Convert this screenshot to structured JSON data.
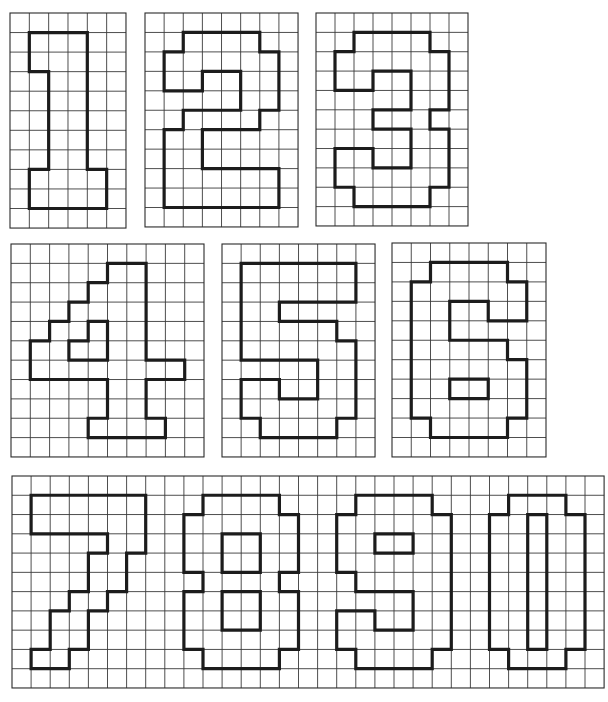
{
  "colors": {
    "background": "#ffffff",
    "grid": "#3a3a3a",
    "outline": "#1c1c1c"
  },
  "grids": [
    {
      "id": "grid-1",
      "label": "1",
      "x": 10,
      "y": 13,
      "cols": 6,
      "rows": 11,
      "cell_w": 19.33,
      "cell_h": 19.55,
      "digits": [
        {
          "digit": "1",
          "polygons": [
            [
              [
                1,
                1
              ],
              [
                4,
                1
              ],
              [
                4,
                8
              ],
              [
                5,
                8
              ],
              [
                5,
                10
              ],
              [
                1,
                10
              ],
              [
                1,
                8
              ],
              [
                2,
                8
              ],
              [
                2,
                3
              ],
              [
                1,
                3
              ]
            ]
          ]
        }
      ]
    },
    {
      "id": "grid-2",
      "label": "2",
      "x": 145,
      "y": 13,
      "cols": 8,
      "rows": 11,
      "cell_w": 19.13,
      "cell_h": 19.45,
      "digits": [
        {
          "digit": "2",
          "polygons": [
            [
              [
                2,
                1
              ],
              [
                6,
                1
              ],
              [
                6,
                2
              ],
              [
                7,
                2
              ],
              [
                7,
                5
              ],
              [
                6,
                5
              ],
              [
                6,
                6
              ],
              [
                3,
                6
              ],
              [
                3,
                8
              ],
              [
                7,
                8
              ],
              [
                7,
                10
              ],
              [
                1,
                10
              ],
              [
                1,
                6
              ],
              [
                2,
                6
              ],
              [
                2,
                5
              ],
              [
                5,
                5
              ],
              [
                5,
                3
              ],
              [
                3,
                3
              ],
              [
                3,
                4
              ],
              [
                1,
                4
              ],
              [
                1,
                2
              ],
              [
                2,
                2
              ]
            ]
          ]
        }
      ]
    },
    {
      "id": "grid-3",
      "label": "3",
      "x": 316,
      "y": 13,
      "cols": 8,
      "rows": 11,
      "cell_w": 19.0,
      "cell_h": 19.36,
      "digits": [
        {
          "digit": "3",
          "polygons": [
            [
              [
                2,
                1
              ],
              [
                6,
                1
              ],
              [
                6,
                2
              ],
              [
                7,
                2
              ],
              [
                7,
                5
              ],
              [
                6,
                5
              ],
              [
                6,
                6
              ],
              [
                7,
                6
              ],
              [
                7,
                9
              ],
              [
                6,
                9
              ],
              [
                6,
                10
              ],
              [
                2,
                10
              ],
              [
                2,
                9
              ],
              [
                1,
                9
              ],
              [
                1,
                7
              ],
              [
                3,
                7
              ],
              [
                3,
                8
              ],
              [
                5,
                8
              ],
              [
                5,
                6
              ],
              [
                3,
                6
              ],
              [
                3,
                5
              ],
              [
                5,
                5
              ],
              [
                5,
                3
              ],
              [
                3,
                3
              ],
              [
                3,
                4
              ],
              [
                1,
                4
              ],
              [
                1,
                2
              ],
              [
                2,
                2
              ]
            ]
          ]
        }
      ]
    },
    {
      "id": "grid-4",
      "label": "4",
      "x": 11,
      "y": 244,
      "cols": 10,
      "rows": 11,
      "cell_w": 19.3,
      "cell_h": 19.36,
      "digits": [
        {
          "digit": "4",
          "polygons": [
            [
              [
                5,
                1
              ],
              [
                7,
                1
              ],
              [
                7,
                6
              ],
              [
                9,
                6
              ],
              [
                9,
                7
              ],
              [
                7,
                7
              ],
              [
                7,
                9
              ],
              [
                8,
                9
              ],
              [
                8,
                10
              ],
              [
                4,
                10
              ],
              [
                4,
                9
              ],
              [
                5,
                9
              ],
              [
                5,
                7
              ],
              [
                1,
                7
              ],
              [
                1,
                5
              ],
              [
                2,
                5
              ],
              [
                2,
                4
              ],
              [
                3,
                4
              ],
              [
                3,
                3
              ],
              [
                4,
                3
              ],
              [
                4,
                2
              ],
              [
                5,
                2
              ]
            ],
            [
              [
                4,
                4
              ],
              [
                5,
                4
              ],
              [
                5,
                6
              ],
              [
                3,
                6
              ],
              [
                3,
                5
              ],
              [
                4,
                5
              ]
            ]
          ]
        }
      ]
    },
    {
      "id": "grid-5",
      "label": "5",
      "x": 222,
      "y": 244,
      "cols": 8,
      "rows": 11,
      "cell_w": 19.13,
      "cell_h": 19.36,
      "digits": [
        {
          "digit": "5",
          "polygons": [
            [
              [
                1,
                1
              ],
              [
                7,
                1
              ],
              [
                7,
                3
              ],
              [
                3,
                3
              ],
              [
                3,
                4
              ],
              [
                6,
                4
              ],
              [
                6,
                5
              ],
              [
                7,
                5
              ],
              [
                7,
                9
              ],
              [
                6,
                9
              ],
              [
                6,
                10
              ],
              [
                2,
                10
              ],
              [
                2,
                9
              ],
              [
                1,
                9
              ],
              [
                1,
                7
              ],
              [
                3,
                7
              ],
              [
                3,
                8
              ],
              [
                5,
                8
              ],
              [
                5,
                6
              ],
              [
                1,
                6
              ]
            ]
          ]
        }
      ]
    },
    {
      "id": "grid-6",
      "label": "6",
      "x": 392,
      "y": 243,
      "cols": 8,
      "rows": 11,
      "cell_w": 19.25,
      "cell_h": 19.45,
      "digits": [
        {
          "digit": "6",
          "polygons": [
            [
              [
                2,
                1
              ],
              [
                6,
                1
              ],
              [
                6,
                2
              ],
              [
                7,
                2
              ],
              [
                7,
                4
              ],
              [
                5,
                4
              ],
              [
                5,
                3
              ],
              [
                3,
                3
              ],
              [
                3,
                5
              ],
              [
                6,
                5
              ],
              [
                6,
                6
              ],
              [
                7,
                6
              ],
              [
                7,
                9
              ],
              [
                6,
                9
              ],
              [
                6,
                10
              ],
              [
                2,
                10
              ],
              [
                2,
                9
              ],
              [
                1,
                9
              ],
              [
                1,
                2
              ],
              [
                2,
                2
              ]
            ],
            [
              [
                3,
                7
              ],
              [
                5,
                7
              ],
              [
                5,
                8
              ],
              [
                3,
                8
              ]
            ]
          ]
        }
      ]
    },
    {
      "id": "grid-7890",
      "label": "7 8 9 0",
      "x": 12,
      "y": 476,
      "cols": 31,
      "rows": 11,
      "cell_w": 19.1,
      "cell_h": 19.27,
      "digits": [
        {
          "digit": "7",
          "polygons": [
            [
              [
                1,
                1
              ],
              [
                7,
                1
              ],
              [
                7,
                4
              ],
              [
                6,
                4
              ],
              [
                6,
                6
              ],
              [
                5,
                6
              ],
              [
                5,
                7
              ],
              [
                4,
                7
              ],
              [
                4,
                9
              ],
              [
                3,
                9
              ],
              [
                3,
                10
              ],
              [
                1,
                10
              ],
              [
                1,
                9
              ],
              [
                2,
                9
              ],
              [
                2,
                7
              ],
              [
                3,
                7
              ],
              [
                3,
                6
              ],
              [
                4,
                6
              ],
              [
                4,
                4
              ],
              [
                5,
                4
              ],
              [
                5,
                3
              ],
              [
                1,
                3
              ]
            ]
          ]
        },
        {
          "digit": "8",
          "polygons": [
            [
              [
                10,
                1
              ],
              [
                14,
                1
              ],
              [
                14,
                2
              ],
              [
                15,
                2
              ],
              [
                15,
                5
              ],
              [
                14,
                5
              ],
              [
                14,
                6
              ],
              [
                15,
                6
              ],
              [
                15,
                9
              ],
              [
                14,
                9
              ],
              [
                14,
                10
              ],
              [
                10,
                10
              ],
              [
                10,
                9
              ],
              [
                9,
                9
              ],
              [
                9,
                6
              ],
              [
                10,
                6
              ],
              [
                10,
                5
              ],
              [
                9,
                5
              ],
              [
                9,
                2
              ],
              [
                10,
                2
              ]
            ],
            [
              [
                11,
                3
              ],
              [
                13,
                3
              ],
              [
                13,
                5
              ],
              [
                11,
                5
              ]
            ],
            [
              [
                11,
                6
              ],
              [
                13,
                6
              ],
              [
                13,
                8
              ],
              [
                11,
                8
              ]
            ]
          ]
        },
        {
          "digit": "9",
          "polygons": [
            [
              [
                18,
                1
              ],
              [
                22,
                1
              ],
              [
                22,
                2
              ],
              [
                23,
                2
              ],
              [
                23,
                9
              ],
              [
                22,
                9
              ],
              [
                22,
                10
              ],
              [
                18,
                10
              ],
              [
                18,
                9
              ],
              [
                17,
                9
              ],
              [
                17,
                7
              ],
              [
                19,
                7
              ],
              [
                19,
                8
              ],
              [
                21,
                8
              ],
              [
                21,
                6
              ],
              [
                18,
                6
              ],
              [
                18,
                5
              ],
              [
                17,
                5
              ],
              [
                17,
                2
              ],
              [
                18,
                2
              ]
            ],
            [
              [
                19,
                3
              ],
              [
                21,
                3
              ],
              [
                21,
                4
              ],
              [
                19,
                4
              ]
            ]
          ]
        },
        {
          "digit": "0",
          "polygons": [
            [
              [
                26,
                1
              ],
              [
                29,
                1
              ],
              [
                29,
                2
              ],
              [
                30,
                2
              ],
              [
                30,
                9
              ],
              [
                29,
                9
              ],
              [
                29,
                10
              ],
              [
                26,
                10
              ],
              [
                26,
                9
              ],
              [
                25,
                9
              ],
              [
                25,
                2
              ],
              [
                26,
                2
              ]
            ],
            [
              [
                27,
                2
              ],
              [
                28,
                2
              ],
              [
                28,
                9
              ],
              [
                27,
                9
              ]
            ]
          ]
        }
      ]
    }
  ]
}
